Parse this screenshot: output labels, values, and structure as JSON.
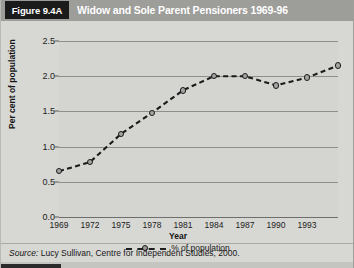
{
  "figure": {
    "tag": "Figure 9.4A",
    "title": "Widow and Sole Parent Pensioners 1969-96",
    "source": "Lucy Sullivan, Centre for Independent Studies, 2000.",
    "source_prefix": "Source:"
  },
  "chart_data": {
    "type": "line",
    "title": "Widow and Sole Parent Pensioners 1969-96",
    "xlabel": "Year",
    "ylabel": "Per cent of population",
    "x": [
      1969,
      1972,
      1975,
      1978,
      1981,
      1984,
      1987,
      1990,
      1993,
      1996
    ],
    "values": [
      0.65,
      0.78,
      1.18,
      1.48,
      1.8,
      2.0,
      2.0,
      1.87,
      1.98,
      2.15
    ],
    "series": [
      {
        "name": "% of population",
        "values": [
          0.65,
          0.78,
          1.18,
          1.48,
          1.8,
          2.0,
          2.0,
          1.87,
          1.98,
          2.15
        ]
      }
    ],
    "xtick_labels": [
      "1969",
      "1972",
      "1975",
      "1978",
      "1981",
      "1984",
      "1987",
      "1990",
      "1993"
    ],
    "xticks": [
      1969,
      1972,
      1975,
      1978,
      1981,
      1984,
      1987,
      1990,
      1993
    ],
    "ytick_labels": [
      "0.0",
      "0.5",
      "1.0",
      "1.5",
      "2.0",
      "2.5"
    ],
    "yticks": [
      0.0,
      0.5,
      1.0,
      1.5,
      2.0,
      2.5
    ],
    "ylim": [
      0.0,
      2.5
    ],
    "xlim": [
      1969,
      1996
    ],
    "grid": true,
    "legend": {
      "position": "bottom-center",
      "entries": [
        "% of population"
      ]
    },
    "line_style": "dashed",
    "marker": "circle",
    "colors": {
      "line": "#1a1a1a",
      "marker_fill": "#a3a3a0",
      "plot_background": "#d4d4d1",
      "header_band": "#9d9d9a",
      "tag_background": "#1b1b1b"
    }
  }
}
